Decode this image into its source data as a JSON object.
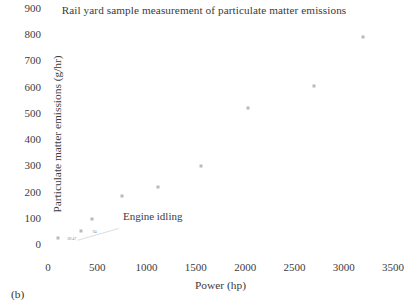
{
  "chart_data": {
    "type": "scatter",
    "title": "Rail yard sample measurement of particulate matter emissions",
    "xlabel": "Power (hp)",
    "ylabel": "Particulate matter emissions (g/hr)",
    "xlim": [
      0,
      3500
    ],
    "ylim": [
      0,
      900
    ],
    "xticks": [
      0,
      500,
      1000,
      1500,
      2000,
      2500,
      3000,
      3500
    ],
    "yticks": [
      0,
      100,
      200,
      300,
      400,
      500,
      600,
      700,
      800,
      900
    ],
    "grid": false,
    "legend": null,
    "marker_color": "#b9b9bd",
    "points": [
      {
        "x": 100,
        "y": 69,
        "label": "69.47"
      },
      {
        "x": 330,
        "y": 94,
        "label": "94"
      },
      {
        "x": 450,
        "y": 140,
        "label": ""
      },
      {
        "x": 750,
        "y": 230,
        "label": ""
      },
      {
        "x": 1120,
        "y": 263,
        "label": ""
      },
      {
        "x": 1550,
        "y": 343,
        "label": ""
      },
      {
        "x": 2030,
        "y": 563,
        "label": ""
      },
      {
        "x": 2700,
        "y": 650,
        "label": ""
      },
      {
        "x": 3200,
        "y": 835,
        "label": ""
      }
    ],
    "annotations": [
      {
        "text": "Engine idling",
        "text_x": 760,
        "text_y": 105,
        "target_x": 300,
        "target_y": 60
      }
    ]
  },
  "caption": "(b)"
}
